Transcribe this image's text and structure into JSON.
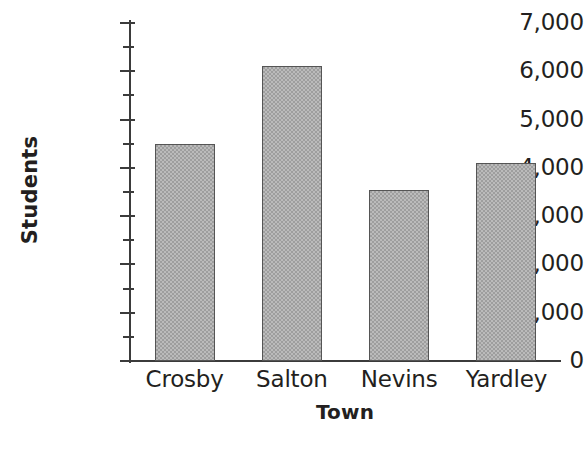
{
  "chart_data": {
    "type": "bar",
    "title": "",
    "xlabel": "Town",
    "ylabel": "Students",
    "categories": [
      "Crosby",
      "Salton",
      "Nevins",
      "Yardley"
    ],
    "values": [
      4500,
      6100,
      3550,
      4100
    ],
    "ylim": [
      0,
      7000
    ],
    "ytick_major_step": 1000,
    "ytick_minor_step": 500,
    "ytick_labels": [
      "7,000",
      "6,000",
      "5,000",
      "4,000",
      "3,000",
      "2,000",
      "1,000",
      "0"
    ],
    "ytick_values": [
      7000,
      6000,
      5000,
      4000,
      3000,
      2000,
      1000,
      0
    ],
    "grid": false,
    "legend": false,
    "legend_position": "none",
    "bar_fill_color": "#9e9e9e",
    "bar_border_color": "#555555",
    "axis_color": "#3b3b3b",
    "text_color": "#231f20",
    "background_color": "#ffffff"
  }
}
